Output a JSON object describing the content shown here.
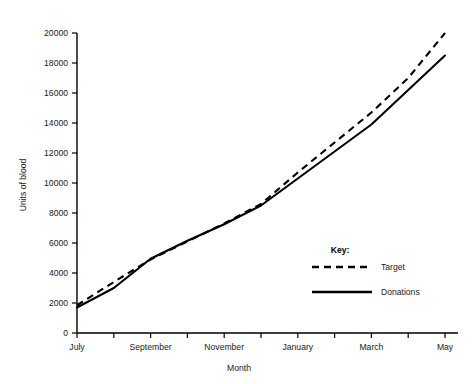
{
  "chart_data": {
    "type": "line",
    "title": "",
    "xlabel": "Month",
    "ylabel": "Units of blood",
    "xlim": [
      0,
      10.6
    ],
    "ylim": [
      0,
      20000
    ],
    "grid": false,
    "legend_position": "inside-right",
    "legend_title": "Key:",
    "x": [
      "July",
      "August",
      "September",
      "October",
      "November",
      "December",
      "January",
      "February",
      "March",
      "April",
      "May"
    ],
    "tick_labels_x": [
      "July",
      "",
      "September",
      "",
      "November",
      "",
      "January",
      "",
      "March",
      "",
      "May"
    ],
    "tick_labels_y": [
      "0",
      "2000",
      "4000",
      "6000",
      "8000",
      "10000",
      "12000",
      "14000",
      "16000",
      "18000",
      "20000"
    ],
    "tick_values_y": [
      0,
      2000,
      4000,
      6000,
      8000,
      10000,
      12000,
      14000,
      16000,
      18000,
      20000
    ],
    "series": [
      {
        "name": "Target",
        "style": "dashed",
        "color": "#000000",
        "values": [
          1850,
          3400,
          4900,
          6100,
          7300,
          8600,
          10700,
          12700,
          14700,
          17000,
          20000
        ]
      },
      {
        "name": "Donations",
        "style": "solid",
        "color": "#000000",
        "values": [
          1700,
          3000,
          4950,
          6150,
          7250,
          8500,
          10300,
          12100,
          13900,
          16200,
          18500
        ]
      }
    ]
  },
  "axes": {
    "y_title": "Units of blood",
    "x_title": "Month"
  },
  "legend": {
    "title": "Key:",
    "entries": [
      {
        "label": "Target",
        "style": "dashed"
      },
      {
        "label": "Donations",
        "style": "solid"
      }
    ]
  },
  "colors": {
    "ink": "#000000",
    "background": "#ffffff"
  }
}
